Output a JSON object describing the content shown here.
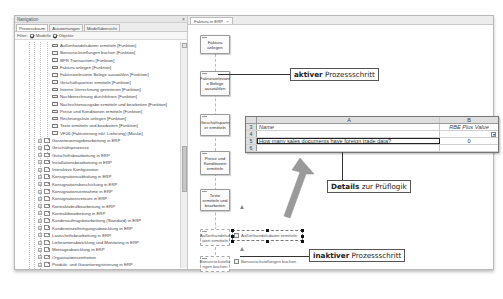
{
  "navigation": {
    "title": "Navigation",
    "close_icon": "×",
    "tabs": [
      {
        "label": "Prozessbaum",
        "active": true
      },
      {
        "label": "Auswertungen",
        "active": false
      },
      {
        "label": "Modellübersicht",
        "active": false
      }
    ],
    "filter": {
      "label": "Filter:",
      "options": [
        {
          "label": "Modelle",
          "checked": true
        },
        {
          "label": "Objekte",
          "checked": true
        }
      ]
    },
    "functions": [
      "Außenhandelsdaten ermitteln [Funktion]",
      "Bonusrückstellungen buchen [Funktion]",
      "BPR Transactions [Funktion]",
      "Faktura anlegen [Funktion]",
      "Fakturarelevante Belege auswählen [Funktion]",
      "Geschäftspartner ermitteln [Funktion]",
      "Interne Verrechnung generieren [Funktion]",
      "Nachberechnung durchführen [Funktion]",
      "Nachrichtenausgabe ermitteln und bearbeiten [Funktion]",
      "Preise und Konditionen ermitteln [Funktion]",
      "Rechnungsliste anlegen [Funktion]",
      "Texte ermitteln und bearbeiten [Funktion]",
      "VF06 (Fakturierung inkl. Lieferung) [Maske]"
    ],
    "folders": [
      "Garantieanträgebearbeitung in ERP",
      "Geschäftsprozesse",
      "Gutschriftsbearbeitung in ERP",
      "Installationsbearbeitung in ERP",
      "Interaktive Konfiguration",
      "Konsignationsabholung in ERP",
      "Konsignationsbeschickung in ERP",
      "Konsignationsentnahme in ERP",
      "Konsignationsretoure in ERP",
      "Kontraktabrufbearbeitung in ERP",
      "Kontraktbearbeitung in ERP",
      "Kundenauftragsbearbeitung (Standard) in ERP",
      "Kundeneinzelfertigungsabwicklung in ERP",
      "Lastschriftsbearbeitung in ERP",
      "Lieferantenabwicklung und Monitoring in ERP",
      "Montageabwicklung in ERP",
      "Organisationseinheiten",
      "Produkt- und Garantieregistrierung in ERP",
      "Provisionsberechnung in ERP",
      "Provisionsnachbearbeitung in ERP",
      "Provisionssystem Basiskonfiguration in ERP",
      "Rechnungskorrekturbearbeitung in ERP",
      "Reklamationsbearbeitung in ERP",
      "Retourenabwicklung in ERP"
    ]
  },
  "editor": {
    "tab": {
      "label": "Faktura in ERP",
      "close_icon": "×"
    },
    "steps": [
      {
        "label": "Faktura anlegen",
        "state": "active"
      },
      {
        "label": "Fakturarelevant e Belege auswählen",
        "state": "active"
      },
      {
        "label": "Geschäftspartn er ermitteln",
        "state": "active"
      },
      {
        "label": "Preise und Konditionen ermitteln",
        "state": "active"
      },
      {
        "label": "Texte ermitteln und bearbeiten",
        "state": "active"
      },
      {
        "label": "Außenhandelsd aten ermitteln",
        "state": "inactive",
        "link": "Außenhandelsdaten ermitteln"
      },
      {
        "label": "Bonusrückstellu ngen buchen",
        "state": "inactive",
        "link": "Bonusrückstellungen buchen"
      }
    ]
  },
  "sheet": {
    "columns": [
      "A",
      "B"
    ],
    "rows": [
      {
        "num": "3",
        "a": "Name",
        "b": "RBE Plus Value"
      },
      {
        "num": "4",
        "a": "",
        "b": "",
        "dropdown": "▾"
      },
      {
        "num": "5",
        "a": "How many sales documents have foreign trade data?",
        "b": "0"
      },
      {
        "num": "6",
        "a": "",
        "b": ""
      }
    ]
  },
  "callouts": {
    "active": {
      "bold": "aktiver",
      "rest": " Prozessschritt"
    },
    "details": {
      "bold": "Details",
      "rest": " zur Prüflogik"
    },
    "inactive": {
      "bold": "inaktiver",
      "rest": " Prozessschritt"
    }
  },
  "colors": {
    "arrow": "#9a9a9a",
    "selection": "#111111"
  }
}
